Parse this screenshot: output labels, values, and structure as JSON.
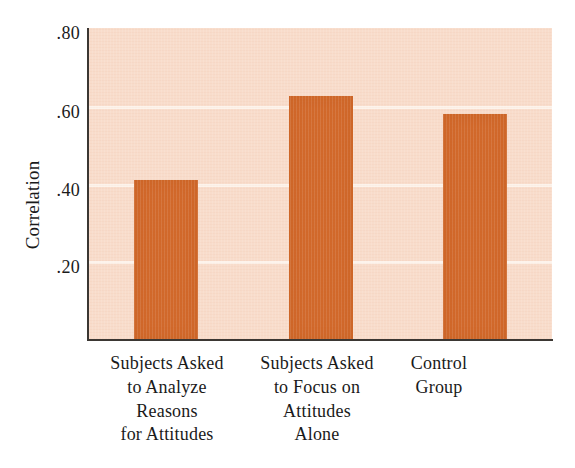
{
  "chart_data": {
    "type": "bar",
    "title": "",
    "subtitle": "",
    "xlabel": "",
    "ylabel": "Correlation",
    "ylim": [
      0.0,
      0.8
    ],
    "grid": true,
    "legend": null,
    "categories": [
      "Subjects Asked to Analyze Reasons for Attitudes",
      "Subjects Asked to Focus on Attitudes Alone",
      "Control Group"
    ],
    "category_lines": [
      [
        "Subjects Asked",
        "to Analyze",
        "Reasons",
        "for Attitudes"
      ],
      [
        "Subjects Asked",
        "to Focus on",
        "Attitudes",
        "Alone"
      ],
      [
        "Control",
        "Group"
      ]
    ],
    "values": [
      0.41,
      0.625,
      0.58
    ],
    "y_ticks": [
      0.2,
      0.4,
      0.6,
      0.8
    ],
    "y_tick_labels": [
      ".20",
      ".40",
      ".60",
      ".80"
    ],
    "colors": {
      "bar": "#d1682a",
      "plot_background": "#f8dccb",
      "gridline": "#fdf3ec",
      "axis": "#3b3733",
      "text": "#1a1a1a",
      "page_background": "#ffffff"
    }
  }
}
